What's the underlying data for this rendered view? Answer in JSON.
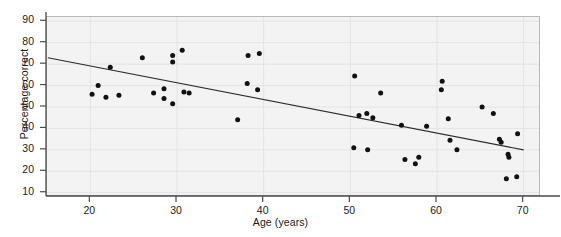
{
  "chart_data": {
    "type": "scatter",
    "title": "",
    "xlabel": "Age (years)",
    "ylabel": "Percentage correct",
    "xlim": [
      15,
      72
    ],
    "ylim": [
      8,
      92
    ],
    "xticks": [
      20,
      30,
      40,
      50,
      60,
      70
    ],
    "yticks": [
      10,
      20,
      30,
      40,
      50,
      60,
      70,
      80,
      90
    ],
    "grid": true,
    "legend": "none",
    "marker_color": "#111111",
    "trendline_color": "#2b2b2b",
    "plot_background": "#f3f3f3",
    "points": [
      {
        "x": 20.2,
        "y": 56.0
      },
      {
        "x": 20.9,
        "y": 60.0
      },
      {
        "x": 21.8,
        "y": 54.5
      },
      {
        "x": 22.3,
        "y": 68.5
      },
      {
        "x": 23.3,
        "y": 55.5
      },
      {
        "x": 26.0,
        "y": 73.0
      },
      {
        "x": 27.3,
        "y": 56.5
      },
      {
        "x": 28.5,
        "y": 54.0
      },
      {
        "x": 28.5,
        "y": 58.5
      },
      {
        "x": 29.5,
        "y": 51.5
      },
      {
        "x": 29.5,
        "y": 74.0
      },
      {
        "x": 29.5,
        "y": 71.0
      },
      {
        "x": 30.6,
        "y": 76.5
      },
      {
        "x": 30.8,
        "y": 57.0
      },
      {
        "x": 31.4,
        "y": 56.5
      },
      {
        "x": 37.0,
        "y": 44.0
      },
      {
        "x": 38.2,
        "y": 74.0
      },
      {
        "x": 39.5,
        "y": 75.0
      },
      {
        "x": 38.1,
        "y": 61.0
      },
      {
        "x": 39.3,
        "y": 58.0
      },
      {
        "x": 50.5,
        "y": 64.5
      },
      {
        "x": 50.4,
        "y": 31.0
      },
      {
        "x": 51.0,
        "y": 46.0
      },
      {
        "x": 51.9,
        "y": 47.0
      },
      {
        "x": 52.0,
        "y": 30.0
      },
      {
        "x": 52.6,
        "y": 45.0
      },
      {
        "x": 53.5,
        "y": 56.5
      },
      {
        "x": 56.3,
        "y": 25.5
      },
      {
        "x": 57.5,
        "y": 23.5
      },
      {
        "x": 57.9,
        "y": 26.5
      },
      {
        "x": 58.8,
        "y": 41.0
      },
      {
        "x": 60.6,
        "y": 62.0
      },
      {
        "x": 60.5,
        "y": 58.0
      },
      {
        "x": 61.3,
        "y": 44.5
      },
      {
        "x": 61.5,
        "y": 34.5
      },
      {
        "x": 65.2,
        "y": 50.0
      },
      {
        "x": 66.5,
        "y": 47.0
      },
      {
        "x": 67.4,
        "y": 33.5
      },
      {
        "x": 67.2,
        "y": 35.0
      },
      {
        "x": 68.2,
        "y": 28.0
      },
      {
        "x": 68.3,
        "y": 26.5
      },
      {
        "x": 68.0,
        "y": 16.5
      },
      {
        "x": 69.2,
        "y": 17.5
      },
      {
        "x": 69.3,
        "y": 37.5
      },
      {
        "x": 62.3,
        "y": 30.0
      },
      {
        "x": 55.9,
        "y": 41.5
      }
    ],
    "trendline": {
      "x1": 15.1,
      "y1": 73.0,
      "x2": 70.0,
      "y2": 30.0
    }
  }
}
